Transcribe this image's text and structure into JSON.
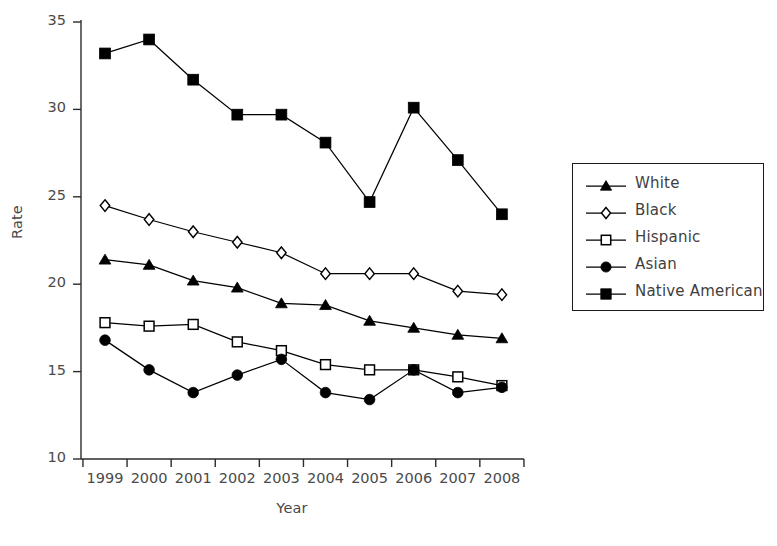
{
  "chart_data": {
    "type": "line",
    "title": "",
    "xlabel": "Year",
    "ylabel": "Rate",
    "categories": [
      "1999",
      "2000",
      "2001",
      "2002",
      "2003",
      "2004",
      "2005",
      "2006",
      "2007",
      "2008"
    ],
    "x": [
      1999,
      2000,
      2001,
      2002,
      2003,
      2004,
      2005,
      2006,
      2007,
      2008
    ],
    "ylim": [
      10,
      35
    ],
    "yticks": [
      10,
      15,
      20,
      25,
      30,
      35
    ],
    "ytick_labels": [
      "10",
      "15",
      "20",
      "25",
      "30",
      "35"
    ],
    "xtick_labels": [
      "1999",
      "2000",
      "2001",
      "2002",
      "2003",
      "2004",
      "2005",
      "2006",
      "2007",
      "2008"
    ],
    "grid": false,
    "legend_position": "right",
    "series": [
      {
        "name": "White",
        "marker": "filled-triangle",
        "color": "#000000",
        "values": [
          21.4,
          21.1,
          20.2,
          19.8,
          18.9,
          18.8,
          17.9,
          17.5,
          17.1,
          16.9
        ]
      },
      {
        "name": "Black",
        "marker": "open-diamond",
        "color": "#000000",
        "values": [
          24.5,
          23.7,
          23.0,
          22.4,
          21.8,
          20.6,
          20.6,
          20.6,
          19.6,
          19.4
        ]
      },
      {
        "name": "Hispanic",
        "marker": "open-square",
        "color": "#000000",
        "values": [
          17.8,
          17.6,
          17.7,
          16.7,
          16.2,
          15.4,
          15.1,
          15.1,
          14.7,
          14.2
        ]
      },
      {
        "name": "Asian",
        "marker": "filled-circle",
        "color": "#000000",
        "values": [
          16.8,
          15.1,
          13.8,
          14.8,
          15.7,
          13.8,
          13.4,
          15.1,
          13.8,
          14.1
        ]
      },
      {
        "name": "Native American",
        "marker": "filled-square",
        "color": "#000000",
        "values": [
          33.2,
          34.0,
          31.7,
          29.7,
          29.7,
          28.1,
          24.7,
          30.1,
          27.1,
          24.0
        ]
      }
    ]
  },
  "legend": {
    "entries": [
      {
        "label": "White"
      },
      {
        "label": "Black"
      },
      {
        "label": "Hispanic"
      },
      {
        "label": "Asian"
      },
      {
        "label": "Native American"
      }
    ]
  },
  "footer": {
    "smudge_text": ""
  }
}
